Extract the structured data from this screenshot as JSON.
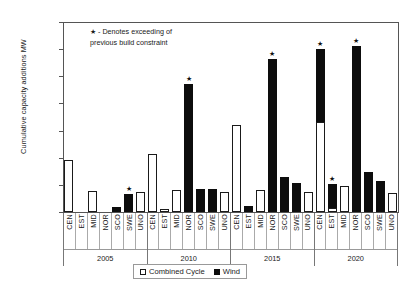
{
  "chart_data": {
    "type": "bar",
    "title": "",
    "xlabel": "",
    "ylabel": "Cumulative capacity additions MW",
    "ylim": [
      0,
      35000
    ],
    "ytick_step": 5000,
    "ytick_labels": [
      "35,000",
      "30,000",
      "25,000",
      "20,000",
      "15,000",
      "10,000",
      "5,000",
      "0"
    ],
    "ytick_values": [
      35000,
      30000,
      25000,
      20000,
      15000,
      10000,
      5000,
      0
    ],
    "grid": false,
    "stacked": true,
    "legend_position": "bottom",
    "legend": [
      "Combined Cycle",
      "Wind"
    ],
    "series": [
      {
        "name": "Combined Cycle",
        "color": "#ffffff"
      },
      {
        "name": "Wind",
        "color": "#0d0d0d"
      }
    ],
    "groups": [
      "2005",
      "2010",
      "2015",
      "2020"
    ],
    "categories": [
      "CEN",
      "EST",
      "MID",
      "NOR",
      "SCO",
      "SWE",
      "UNO"
    ],
    "annotation": {
      "symbol": "★",
      "text": "- Denotes exceeding of previous build constraint",
      "line1": "- Denotes exceeding of",
      "line2": "previous build constraint"
    },
    "data": [
      {
        "group": "2005",
        "bars": [
          {
            "region": "CEN",
            "combined_cycle": 9500,
            "wind": 0,
            "star": false
          },
          {
            "region": "EST",
            "combined_cycle": 0,
            "wind": 0,
            "star": false
          },
          {
            "region": "MID",
            "combined_cycle": 3900,
            "wind": 0,
            "star": false
          },
          {
            "region": "NOR",
            "combined_cycle": 0,
            "wind": 0,
            "star": false
          },
          {
            "region": "SCO",
            "combined_cycle": 0,
            "wind": 1000,
            "star": false
          },
          {
            "region": "SWE",
            "combined_cycle": 0,
            "wind": 3400,
            "star": true
          },
          {
            "region": "UNO",
            "combined_cycle": 3600,
            "wind": 0,
            "star": false
          }
        ]
      },
      {
        "group": "2010",
        "bars": [
          {
            "region": "CEN",
            "combined_cycle": 10700,
            "wind": 0,
            "star": false
          },
          {
            "region": "EST",
            "combined_cycle": 500,
            "wind": 0,
            "star": false
          },
          {
            "region": "MID",
            "combined_cycle": 4000,
            "wind": 0,
            "star": false
          },
          {
            "region": "NOR",
            "combined_cycle": 0,
            "wind": 23500,
            "star": true
          },
          {
            "region": "SCO",
            "combined_cycle": 0,
            "wind": 4200,
            "star": false
          },
          {
            "region": "SWE",
            "combined_cycle": 0,
            "wind": 4200,
            "star": false
          },
          {
            "region": "UNO",
            "combined_cycle": 3600,
            "wind": 0,
            "star": false
          }
        ]
      },
      {
        "group": "2015",
        "bars": [
          {
            "region": "CEN",
            "combined_cycle": 16000,
            "wind": 0,
            "star": false
          },
          {
            "region": "EST",
            "combined_cycle": 0,
            "wind": 1200,
            "star": false
          },
          {
            "region": "MID",
            "combined_cycle": 4000,
            "wind": 0,
            "star": false
          },
          {
            "region": "NOR",
            "combined_cycle": 0,
            "wind": 28200,
            "star": true
          },
          {
            "region": "SCO",
            "combined_cycle": 0,
            "wind": 6500,
            "star": false
          },
          {
            "region": "SWE",
            "combined_cycle": 0,
            "wind": 5300,
            "star": false
          },
          {
            "region": "UNO",
            "combined_cycle": 3700,
            "wind": 0,
            "star": false
          }
        ]
      },
      {
        "group": "2020",
        "bars": [
          {
            "region": "CEN",
            "combined_cycle": 16500,
            "wind": 13500,
            "star": true
          },
          {
            "region": "EST",
            "combined_cycle": 800,
            "wind": 4300,
            "star": true
          },
          {
            "region": "MID",
            "combined_cycle": 4800,
            "wind": 0,
            "star": false
          },
          {
            "region": "NOR",
            "combined_cycle": 0,
            "wind": 30600,
            "star": true
          },
          {
            "region": "SCO",
            "combined_cycle": 0,
            "wind": 7400,
            "star": false
          },
          {
            "region": "SWE",
            "combined_cycle": 0,
            "wind": 5800,
            "star": false
          },
          {
            "region": "UNO",
            "combined_cycle": 3500,
            "wind": 0,
            "star": false
          }
        ]
      }
    ]
  }
}
